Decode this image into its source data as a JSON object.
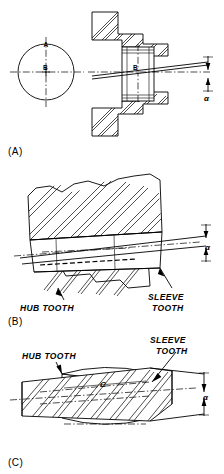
{
  "figure": {
    "panels": [
      {
        "id": "A",
        "label": "(A)",
        "view": "end view circle plus sectioned side view of coupling",
        "labels": [
          {
            "name": "circle-top-label",
            "text": "A"
          },
          {
            "name": "circle-center-label",
            "text": "B"
          },
          {
            "name": "section-center-label",
            "text": "B"
          },
          {
            "name": "angle-label",
            "text": "α"
          }
        ]
      },
      {
        "id": "B",
        "label": "(B)",
        "view": "enlarged sectioned tooth engagement, misaligned",
        "labels": [
          {
            "name": "hub-tooth-label",
            "text": "HUB  TOOTH"
          },
          {
            "name": "sleeve-tooth-label-line1",
            "text": "SLEEVE"
          },
          {
            "name": "sleeve-tooth-label-line2",
            "text": "TOOTH"
          },
          {
            "name": "angle-label",
            "text": "α"
          }
        ]
      },
      {
        "id": "C",
        "label": "(C)",
        "view": "crowned tooth contact view with dimension C",
        "labels": [
          {
            "name": "hub-tooth-label",
            "text": "HUB  TOOTH"
          },
          {
            "name": "sleeve-tooth-label-line1",
            "text": "SLEEVE"
          },
          {
            "name": "sleeve-tooth-label-line2",
            "text": "TOOTH"
          },
          {
            "name": "dimension-c-label",
            "text": "C"
          },
          {
            "name": "angle-label",
            "text": "α"
          }
        ]
      }
    ],
    "symbols": {
      "alpha": "α",
      "dimension_c": "C",
      "datum_a": "A",
      "datum_b": "B"
    },
    "colors": {
      "line": "#000000",
      "background": "#ffffff"
    }
  }
}
